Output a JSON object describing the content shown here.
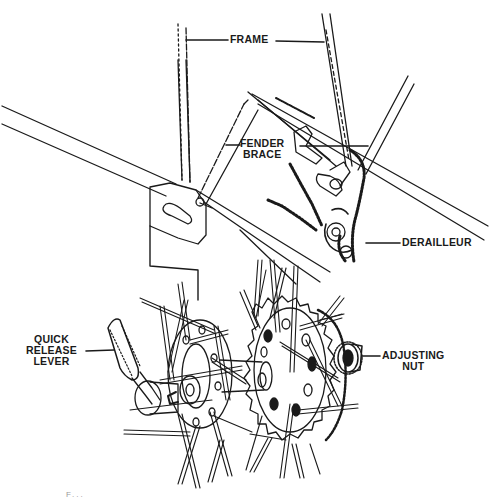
{
  "figure": {
    "style": "black-and-white line illustration",
    "colors": {
      "background": "#ffffff",
      "ink": "#1a1a1a"
    },
    "labels": {
      "frame": "FRAME",
      "fender_brace_line1": "FENDER",
      "fender_brace_line2": "BRACE",
      "derailleur": "DERAILLEUR",
      "quick_release_line1": "QUICK",
      "quick_release_line2": "RELEASE",
      "quick_release_line3": "LEVER",
      "adjusting_nut_line1": "ADJUSTING",
      "adjusting_nut_line2": "NUT"
    },
    "caption": "F..."
  }
}
